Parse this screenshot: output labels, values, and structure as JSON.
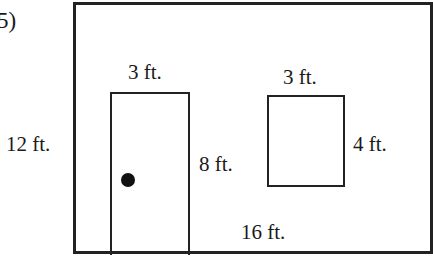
{
  "problem_number": "5)",
  "wall": {
    "width_label": "16 ft.",
    "height_label": "12 ft."
  },
  "door": {
    "width_label": "3 ft.",
    "height_label": "8 ft."
  },
  "window": {
    "width_label": "3 ft.",
    "height_label": "4 ft."
  },
  "colors": {
    "line": "#222222",
    "background": "#ffffff"
  }
}
